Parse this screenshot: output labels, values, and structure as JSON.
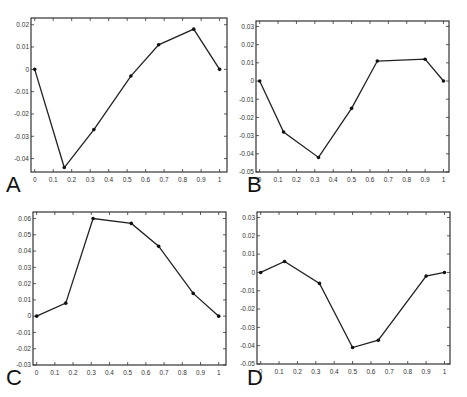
{
  "figure": {
    "panels": [
      {
        "letter": "A"
      },
      {
        "letter": "B"
      },
      {
        "letter": "C"
      },
      {
        "letter": "D"
      }
    ]
  },
  "colors": {
    "line": "#222222",
    "marker": "#111111",
    "axes": "#333333",
    "background": "#ffffff"
  },
  "chart_data": [
    {
      "type": "line",
      "panel": "A",
      "title": "",
      "xlabel": "",
      "ylabel": "",
      "xlim": [
        -0.02,
        1.04
      ],
      "ylim": [
        -0.046,
        0.023
      ],
      "xticks": [
        0,
        0.1,
        0.2,
        0.3,
        0.4,
        0.5,
        0.6,
        0.7,
        0.8,
        0.9,
        1
      ],
      "xtick_labels": [
        "0",
        "0.1",
        "0.2",
        "0.3",
        "0.4",
        "0.5",
        "0.6",
        "0.7",
        "0.8",
        "0.9",
        "1"
      ],
      "yticks": [
        0.02,
        0.01,
        0,
        -0.01,
        -0.02,
        -0.03,
        -0.04
      ],
      "ytick_labels": [
        "0.02",
        "0.01",
        "0",
        "-0.01",
        "-0.02",
        "-0.03",
        "-0.04"
      ],
      "grid": false,
      "x": [
        0,
        0.16,
        0.32,
        0.52,
        0.67,
        0.86,
        1
      ],
      "values": [
        0,
        -0.044,
        -0.027,
        -0.003,
        0.011,
        0.018,
        0
      ],
      "frame": {
        "left": 31,
        "top": 18,
        "right": 227,
        "bottom": 172
      },
      "letter_pos": {
        "x": 6,
        "y": 174
      }
    },
    {
      "type": "line",
      "panel": "B",
      "title": "",
      "xlabel": "",
      "ylabel": "",
      "xlim": [
        -0.02,
        1.03
      ],
      "ylim": [
        -0.05,
        0.033
      ],
      "xticks": [
        0,
        0.1,
        0.2,
        0.3,
        0.4,
        0.5,
        0.6,
        0.7,
        0.8,
        0.9,
        1
      ],
      "xtick_labels": [
        "0",
        "0.1",
        "0.2",
        "0.3",
        "0.4",
        "0.5",
        "0.6",
        "0.7",
        "0.8",
        "0.9",
        "1"
      ],
      "yticks": [
        0.03,
        0.02,
        0.01,
        0,
        -0.01,
        -0.02,
        -0.03,
        -0.04,
        -0.05
      ],
      "ytick_labels": [
        "0.03",
        "0.02",
        "0.01",
        "0",
        "-0.01",
        "-0.02",
        "-0.03",
        "-0.04",
        "-0.05"
      ],
      "grid": false,
      "x": [
        0,
        0.13,
        0.32,
        0.5,
        0.64,
        0.9,
        1
      ],
      "values": [
        0,
        -0.028,
        -0.042,
        -0.015,
        0.011,
        0.012,
        0
      ],
      "frame": {
        "left": 256,
        "top": 21,
        "right": 449,
        "bottom": 172
      },
      "letter_pos": {
        "x": 247,
        "y": 174
      }
    },
    {
      "type": "line",
      "panel": "C",
      "title": "",
      "xlabel": "",
      "ylabel": "",
      "xlim": [
        -0.02,
        1.04
      ],
      "ylim": [
        -0.03,
        0.064
      ],
      "xticks": [
        0,
        0.1,
        0.2,
        0.3,
        0.4,
        0.5,
        0.6,
        0.7,
        0.8,
        0.9,
        1
      ],
      "xtick_labels": [
        "0",
        "0.1",
        "0.2",
        "0.3",
        "0.4",
        "0.5",
        "0.6",
        "0.7",
        "0.8",
        "0.9",
        "1"
      ],
      "yticks": [
        0.06,
        0.05,
        0.04,
        0.03,
        0.02,
        0.01,
        0,
        -0.01,
        -0.02,
        -0.03
      ],
      "ytick_labels": [
        "0.06",
        "0.05",
        "0.04",
        "0.03",
        "0.02",
        "0.01",
        "0",
        "-0.01",
        "-0.02",
        "-0.03"
      ],
      "grid": false,
      "x": [
        0,
        0.16,
        0.31,
        0.52,
        0.67,
        0.86,
        1
      ],
      "values": [
        0,
        0.008,
        0.06,
        0.057,
        0.043,
        0.014,
        0
      ],
      "frame": {
        "left": 33,
        "top": 212,
        "right": 226,
        "bottom": 365
      },
      "letter_pos": {
        "x": 6,
        "y": 367
      }
    },
    {
      "type": "line",
      "panel": "D",
      "title": "",
      "xlabel": "",
      "ylabel": "",
      "xlim": [
        -0.02,
        1.03
      ],
      "ylim": [
        -0.05,
        0.033
      ],
      "xticks": [
        0,
        0.1,
        0.2,
        0.3,
        0.4,
        0.5,
        0.6,
        0.7,
        0.8,
        0.9,
        1
      ],
      "xtick_labels": [
        "0",
        "0.1",
        "0.2",
        "0.3",
        "0.4",
        "0.5",
        "0.6",
        "0.7",
        "0.8",
        "0.9",
        "1"
      ],
      "yticks": [
        0.03,
        0.02,
        0.01,
        0,
        -0.01,
        -0.02,
        -0.03,
        -0.04,
        -0.05
      ],
      "ytick_labels": [
        "0.03",
        "0.02",
        "0.01",
        "0",
        "-0.01",
        "-0.02",
        "-0.03",
        "-0.04",
        "-0.05"
      ],
      "grid": false,
      "x": [
        0,
        0.13,
        0.32,
        0.5,
        0.64,
        0.9,
        1
      ],
      "values": [
        0,
        0.006,
        -0.006,
        -0.041,
        -0.037,
        -0.002,
        0
      ],
      "frame": {
        "left": 257,
        "top": 212,
        "right": 450,
        "bottom": 364
      },
      "letter_pos": {
        "x": 247,
        "y": 367
      }
    }
  ]
}
